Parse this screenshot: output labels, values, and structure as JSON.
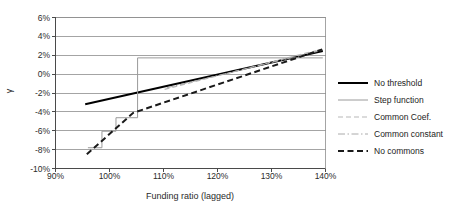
{
  "chart_data": {
    "type": "line",
    "title": "",
    "xlabel": "Funding ratio (lagged)",
    "ylabel": "γ",
    "xlim": [
      90,
      140
    ],
    "ylim": [
      -10,
      6
    ],
    "xticks": [
      "90%",
      "100%",
      "110%",
      "120%",
      "130%",
      "140%"
    ],
    "xtick_values": [
      90,
      100,
      110,
      120,
      130,
      140
    ],
    "yticks": [
      "6%",
      "4%",
      "2%",
      "0%",
      "-2%",
      "-4%",
      "-6%",
      "-8%",
      "-10%"
    ],
    "ytick_values": [
      6,
      4,
      2,
      0,
      -2,
      -4,
      -6,
      -8,
      -10
    ],
    "grid": "horizontal",
    "legend_position": "right",
    "series": [
      {
        "name": "No threshold",
        "style": "solid-thick-black",
        "color": "#000000",
        "points": [
          [
            95.5,
            -3.2
          ],
          [
            139.5,
            2.45
          ]
        ]
      },
      {
        "name": "Step function",
        "style": "solid-thin-gray",
        "color": "#9a9a9a",
        "points": [
          [
            96.0,
            -7.8
          ],
          [
            98.6,
            -7.8
          ],
          [
            98.6,
            -6.05
          ],
          [
            101.2,
            -6.05
          ],
          [
            101.2,
            -4.62
          ],
          [
            105.2,
            -4.62
          ],
          [
            105.2,
            1.72
          ],
          [
            139.5,
            1.72
          ]
        ]
      },
      {
        "name": "Common Coef.",
        "style": "dashed-light-gray",
        "color": "#b8b8b8",
        "points": [
          [
            110.2,
            -1.62
          ],
          [
            139.0,
            2.6
          ]
        ]
      },
      {
        "name": "Common constant",
        "style": "dashdot-thin-gray",
        "color": "#aaaaaa",
        "points": [
          [
            110.6,
            -1.45
          ],
          [
            139.2,
            2.5
          ]
        ]
      },
      {
        "name": "No commons",
        "style": "dashed-thick-black",
        "color": "#1a1a1a",
        "points": [
          [
            95.8,
            -8.5
          ],
          [
            104.4,
            -4.1
          ],
          [
            139.4,
            2.62
          ]
        ]
      }
    ]
  },
  "legend": {
    "items": [
      {
        "label": "No threshold"
      },
      {
        "label": "Step function"
      },
      {
        "label": "Common Coef."
      },
      {
        "label": "Common constant"
      },
      {
        "label": "No commons"
      }
    ]
  },
  "axes": {
    "x_title": "Funding ratio (lagged)",
    "y_title": "γ"
  }
}
